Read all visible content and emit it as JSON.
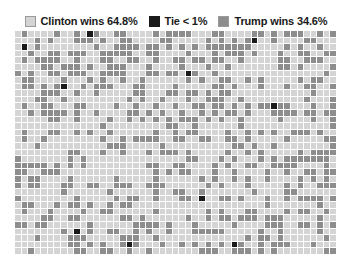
{
  "chart_data": {
    "type": "waffle",
    "title": "",
    "xlabel": "",
    "ylabel": "",
    "grid": {
      "columns": 49,
      "rows": 34,
      "total_cells": 1666
    },
    "categories": [
      "Clinton wins",
      "Tie",
      "Trump wins"
    ],
    "values": [
      64.8,
      0.6,
      34.6
    ],
    "value_unit": "%",
    "cell_counts": [
      1080,
      10,
      576
    ],
    "colors": [
      "#d4d4d4",
      "#1a1a1a",
      "#8d8d8d"
    ],
    "gridline_color": "#ffffff",
    "legend_position": "top-center",
    "grid_visible": true,
    "series": [
      {
        "name": "Clinton wins",
        "value": 64.8,
        "color": "#d4d4d4",
        "cells": 1080
      },
      {
        "name": "Tie",
        "value": 0.6,
        "color": "#1a1a1a",
        "cells": 10
      },
      {
        "name": "Trump wins",
        "value": 34.6,
        "color": "#8d8d8d",
        "cells": 576
      }
    ]
  },
  "legend": {
    "items": [
      {
        "label": "Clinton wins 64.8%",
        "color": "#d4d4d4",
        "key": "clinton"
      },
      {
        "label": "Tie < 1%",
        "color": "#1a1a1a",
        "key": "tie"
      },
      {
        "label": "Trump wins 34.6%",
        "color": "#8d8d8d",
        "key": "trump"
      }
    ]
  },
  "background": "#ffffff"
}
